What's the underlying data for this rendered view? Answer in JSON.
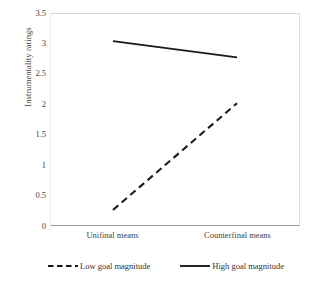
{
  "chart_data": {
    "type": "line",
    "title": "",
    "subtitle": "",
    "xlabel": "",
    "ylabel": "Instrumentality ratings",
    "categories": [
      "Unifinal means",
      "Counterfinal means"
    ],
    "ylim": [
      0,
      3.5
    ],
    "yticks": [
      "0",
      "0.5",
      "1",
      "1.5",
      "2",
      "2.5",
      "3",
      "3.5"
    ],
    "ytick_values": [
      0,
      0.5,
      1,
      1.5,
      2,
      2.5,
      3,
      3.5
    ],
    "grid": false,
    "legend_position": "bottom",
    "series": [
      {
        "name": "Low goal magnitude",
        "style": "dashed",
        "color": "#1a1a1a",
        "values": [
          0.25,
          2.02
        ]
      },
      {
        "name": "High goal magnitude",
        "style": "solid",
        "color": "#1a1a1a",
        "values": [
          3.05,
          2.78
        ]
      }
    ]
  },
  "axes": {
    "y_title": "Instrumentality ratings",
    "y_ticks": [
      "3.5",
      "3",
      "2.5",
      "2",
      "1.5",
      "1",
      "0.5",
      "0"
    ],
    "x_ticks": [
      "Unifinal means",
      "Counterfinal means"
    ]
  },
  "legend": {
    "entries": [
      {
        "label": "Low goal magnitude",
        "icon": "dashed-line-icon"
      },
      {
        "label": "High goal magnitude",
        "icon": "solid-line-icon"
      }
    ]
  },
  "colors": {
    "line": "#1a1a1a",
    "axis": "#9d9d9d",
    "frame": "#e2e2e2",
    "text": "#3f3f3f",
    "background": "#ffffff"
  }
}
